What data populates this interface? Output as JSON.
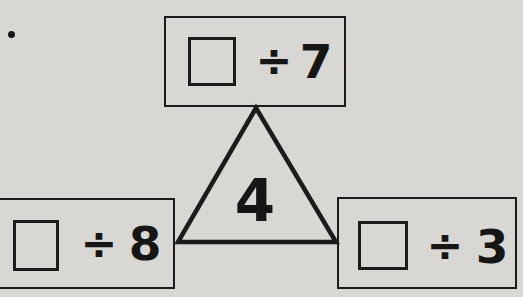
{
  "colors": {
    "background": "#d8d7d3",
    "line": "#1b1b1b",
    "text": "#161616"
  },
  "list_marker": ".",
  "triangle": {
    "center_number": "4"
  },
  "boxes": {
    "top": {
      "operator": "÷",
      "divisor": "7"
    },
    "bottom_left": {
      "operator": "÷",
      "divisor": "8"
    },
    "bottom_right": {
      "operator": "÷",
      "divisor": "3"
    }
  }
}
